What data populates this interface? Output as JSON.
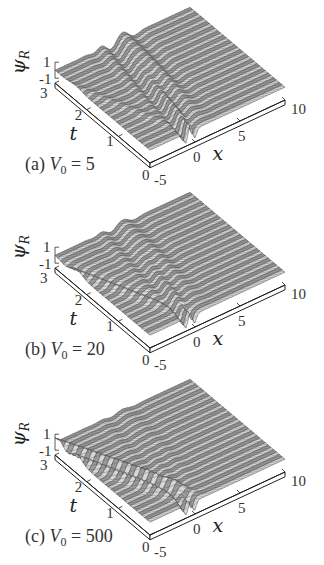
{
  "figure": {
    "width": 324,
    "height": 565
  },
  "chart_data": [
    {
      "type": "surface3d",
      "panel": "a",
      "caption_prefix": "(a) ",
      "caption_var": "V",
      "caption_sub": "0",
      "caption_eq": " = 5",
      "V0": 5,
      "xlabel": "x",
      "ylabel": "t",
      "zlabel": "ψ",
      "zlabel_sub": "R",
      "x_ticks": [
        "-5",
        "0",
        "5",
        "10"
      ],
      "x_range": [
        -5,
        10
      ],
      "t_ticks": [
        "0",
        "1",
        "2",
        "3"
      ],
      "t_range": [
        0,
        3
      ],
      "z_ticks": [
        "-1",
        "1"
      ],
      "z_range": [
        -1,
        1
      ],
      "reflected_ridges": 1,
      "reflection_amplitude": 0.25,
      "description": "Wave packet incident at x≈0, t=0, mostly transmitted to the right, weak reflected ridge toward negative x"
    },
    {
      "type": "surface3d",
      "panel": "b",
      "caption_prefix": "(b) ",
      "caption_var": "V",
      "caption_sub": "0",
      "caption_eq": " = 20",
      "V0": 20,
      "xlabel": "x",
      "ylabel": "t",
      "zlabel": "ψ",
      "zlabel_sub": "R",
      "x_ticks": [
        "-5",
        "0",
        "5",
        "10"
      ],
      "x_range": [
        -5,
        10
      ],
      "t_ticks": [
        "0",
        "1",
        "2",
        "3"
      ],
      "t_range": [
        0,
        3
      ],
      "z_ticks": [
        "-1",
        "1"
      ],
      "z_range": [
        -1,
        1
      ],
      "reflected_ridges": 2,
      "reflection_amplitude": 0.6,
      "description": "Stronger reflected wave ridges toward negative x, transmitted packet still visible"
    },
    {
      "type": "surface3d",
      "panel": "c",
      "caption_prefix": "(c) ",
      "caption_var": "V",
      "caption_sub": "0",
      "caption_eq": " = 500",
      "V0": 500,
      "xlabel": "x",
      "ylabel": "t",
      "zlabel": "ψ",
      "zlabel_sub": "R",
      "x_ticks": [
        "-5",
        "0",
        "5",
        "10"
      ],
      "x_range": [
        -5,
        10
      ],
      "t_ticks": [
        "0",
        "1",
        "2",
        "3"
      ],
      "t_range": [
        0,
        3
      ],
      "z_ticks": [
        "-1",
        "1"
      ],
      "z_range": [
        -1,
        1
      ],
      "reflected_ridges": 3,
      "reflection_amplitude": 0.9,
      "description": "Nearly total reflection: multiple strong ridges toward negative x, flat transmitted region"
    }
  ]
}
